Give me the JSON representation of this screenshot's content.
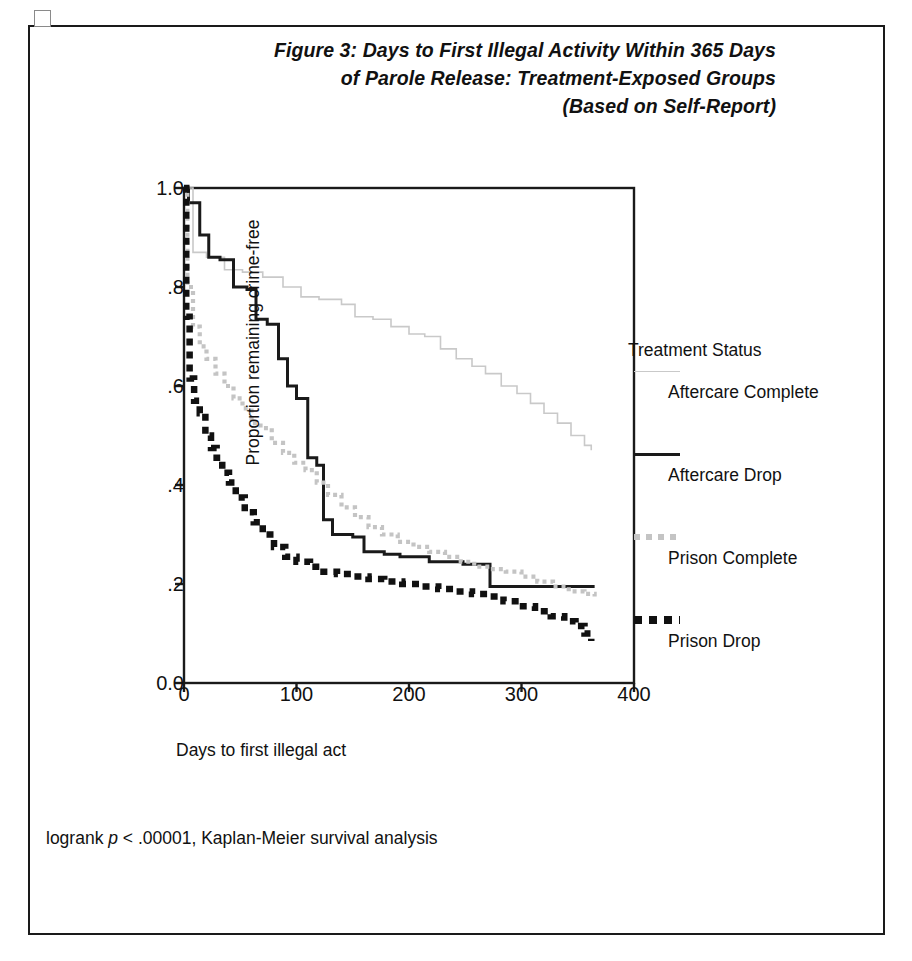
{
  "figure": {
    "bullet_icon": "empty-square-bullet",
    "title_lines": [
      "Figure 3: Days to First Illegal Activity Within 365 Days",
      "of Parole Release: Treatment-Exposed Groups",
      "(Based on Self-Report)"
    ],
    "footnote_prefix": "logrank ",
    "footnote_italic": "p",
    "footnote_suffix": " < .00001, Kaplan-Meier survival analysis"
  },
  "legend": {
    "title": "Treatment Status",
    "entries": [
      {
        "label": "Aftercare Complete",
        "swatch": "thin-light-gray-line",
        "color": "#c9c9c9"
      },
      {
        "label": "Aftercare Drop",
        "swatch": "solid-black-line",
        "color": "#1a1a1a"
      },
      {
        "label": "Prison Complete",
        "swatch": "light-gray-dotted-line",
        "color": "#c4c4c4"
      },
      {
        "label": "Prison Drop",
        "swatch": "heavy-black-dashed-line",
        "color": "#111111"
      }
    ]
  },
  "chart_data": {
    "type": "line",
    "title": "Figure 3: Days to First Illegal Activity Within 365 Days of Parole Release: Treatment-Exposed Groups (Based on Self-Report)",
    "subtitle": "Kaplan-Meier survival curves",
    "xlabel": "Days to first illegal act",
    "ylabel": "Proportion remaining crime-free",
    "xlim": [
      0,
      400
    ],
    "ylim": [
      0.0,
      1.0
    ],
    "xticks": [
      0,
      100,
      200,
      300,
      400
    ],
    "xtick_labels": [
      "0",
      "100",
      "200",
      "300",
      "400"
    ],
    "yticks": [
      0.0,
      0.2,
      0.4,
      0.6,
      0.8,
      1.0
    ],
    "ytick_labels": [
      "0.0",
      ".2",
      ".4",
      ".6",
      ".8",
      "1.0"
    ],
    "grid": false,
    "legend_position": "right",
    "step_style": "post",
    "annotation": "logrank p < .00001, Kaplan-Meier survival analysis",
    "series": [
      {
        "name": "Aftercare Complete",
        "color": "#c9c9c9",
        "style": "thin-solid",
        "x": [
          0,
          8,
          20,
          36,
          52,
          70,
          88,
          104,
          120,
          140,
          152,
          168,
          184,
          200,
          214,
          228,
          242,
          256,
          268,
          282,
          296,
          308,
          320,
          332,
          344,
          356,
          362
        ],
        "y": [
          1.0,
          0.87,
          0.86,
          0.835,
          0.83,
          0.82,
          0.8,
          0.78,
          0.775,
          0.765,
          0.74,
          0.735,
          0.72,
          0.705,
          0.7,
          0.675,
          0.655,
          0.64,
          0.625,
          0.6,
          0.585,
          0.565,
          0.545,
          0.525,
          0.5,
          0.48,
          0.47
        ]
      },
      {
        "name": "Aftercare Drop",
        "color": "#1a1a1a",
        "style": "medium-solid",
        "x": [
          0,
          4,
          14,
          22,
          32,
          44,
          56,
          64,
          74,
          84,
          92,
          100,
          110,
          118,
          124,
          132,
          150,
          160,
          178,
          192,
          218,
          248,
          272,
          286,
          310,
          340,
          365
        ],
        "y": [
          1.0,
          0.97,
          0.905,
          0.86,
          0.855,
          0.8,
          0.795,
          0.735,
          0.725,
          0.655,
          0.6,
          0.575,
          0.455,
          0.44,
          0.33,
          0.3,
          0.295,
          0.265,
          0.26,
          0.255,
          0.245,
          0.24,
          0.195,
          0.195,
          0.195,
          0.195,
          0.195
        ]
      },
      {
        "name": "Prison Complete",
        "color": "#c4c4c4",
        "style": "light-dotted",
        "x": [
          0,
          3,
          8,
          14,
          20,
          28,
          36,
          44,
          52,
          60,
          68,
          78,
          88,
          98,
          108,
          118,
          128,
          140,
          152,
          164,
          176,
          190,
          204,
          218,
          232,
          246,
          258,
          272,
          286,
          300,
          314,
          328,
          342,
          356,
          365
        ],
        "y": [
          1.0,
          0.8,
          0.72,
          0.68,
          0.655,
          0.625,
          0.6,
          0.575,
          0.555,
          0.525,
          0.515,
          0.485,
          0.465,
          0.445,
          0.43,
          0.405,
          0.38,
          0.355,
          0.335,
          0.315,
          0.3,
          0.285,
          0.275,
          0.265,
          0.255,
          0.245,
          0.235,
          0.23,
          0.225,
          0.215,
          0.205,
          0.195,
          0.185,
          0.18,
          0.175
        ]
      },
      {
        "name": "Prison Drop",
        "color": "#111111",
        "style": "heavy-dashed",
        "x": [
          0,
          2,
          5,
          9,
          14,
          19,
          24,
          29,
          34,
          40,
          46,
          54,
          62,
          70,
          80,
          90,
          100,
          112,
          124,
          136,
          150,
          164,
          178,
          194,
          210,
          226,
          242,
          256,
          270,
          284,
          298,
          312,
          326,
          338,
          348,
          356,
          362
        ],
        "y": [
          1.0,
          0.74,
          0.615,
          0.57,
          0.545,
          0.5,
          0.475,
          0.455,
          0.425,
          0.405,
          0.375,
          0.345,
          0.325,
          0.3,
          0.275,
          0.255,
          0.245,
          0.235,
          0.225,
          0.22,
          0.215,
          0.21,
          0.205,
          0.2,
          0.195,
          0.19,
          0.185,
          0.18,
          0.175,
          0.165,
          0.155,
          0.145,
          0.135,
          0.125,
          0.115,
          0.1,
          0.085
        ]
      }
    ]
  }
}
